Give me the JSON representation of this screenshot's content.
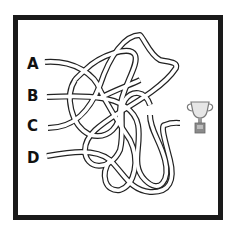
{
  "puzzle": {
    "type": "tangled-path maze",
    "start_labels": [
      "A",
      "B",
      "C",
      "D"
    ],
    "goal": "trophy-icon"
  },
  "colors": {
    "frame": "#1a1a1a",
    "path_outline": "#222222",
    "path_fill": "#ffffff",
    "label": "#111111",
    "trophy": "#8a8a8a"
  }
}
